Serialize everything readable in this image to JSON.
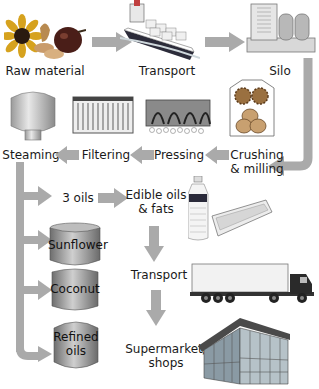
{
  "diagram": {
    "colors": {
      "arrow": "#aaaaaa",
      "text": "#1a1a1a",
      "tank_dark": "#7a7a7a",
      "tank_light": "#d0d0d0"
    },
    "stages": {
      "raw_material": "Raw material",
      "transport_1": "Transport",
      "silo": "Silo",
      "crushing_line1": "Crushing",
      "crushing_line2": "& milling",
      "pressing": "Pressing",
      "filtering": "Filtering",
      "steaming": "Steaming",
      "three_oils": "3 oils",
      "edible_line1": "Edible oils",
      "edible_line2": "& fats",
      "transport_2": "Transport",
      "supermarket_line1": "Supermarket/",
      "supermarket_line2": "shops"
    },
    "tanks": [
      {
        "line1": "Sunflower",
        "line2": ""
      },
      {
        "line1": "Coconut",
        "line2": ""
      },
      {
        "line1": "Refined",
        "line2": "oils"
      }
    ],
    "flow": [
      "Raw material",
      "Transport",
      "Silo",
      "Crushing & milling",
      "Pressing",
      "Filtering",
      "Steaming",
      "3 oils",
      "Edible oils & fats",
      "Transport",
      "Supermarket/shops"
    ]
  }
}
